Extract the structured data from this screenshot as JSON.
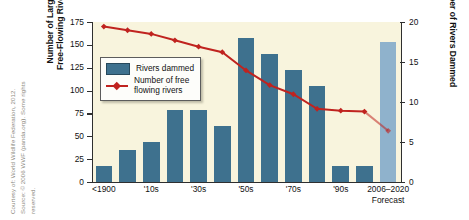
{
  "credit": {
    "lines": [
      "Courtesy of: World Wildlife Federation, 2012.",
      "Source: © 2006 WWF (panda.org). Some rights",
      "reserved."
    ]
  },
  "legend": {
    "items": [
      {
        "label": "Rivers dammed",
        "marker": "bar-swatch",
        "color": "#3e718e"
      },
      {
        "label_line1": "Number of free",
        "label_line2": "flowing rivers",
        "marker": "line-diamond",
        "color": "#c0231f"
      }
    ]
  },
  "axes": {
    "left": {
      "title_line1": "Number of Large",
      "title_line2": "Free-Flowing Rivers",
      "ticks": [
        "0",
        "25",
        "50",
        "75",
        "100",
        "125",
        "150",
        "175"
      ],
      "min": 0,
      "max": 175
    },
    "right": {
      "title": "Number of Rivers Dammed",
      "ticks": [
        "0",
        "5",
        "10",
        "15",
        "20"
      ],
      "min": 0,
      "max": 20
    },
    "x": {
      "tick_labels": [
        {
          "label": "<1900",
          "sub": ""
        },
        {
          "label": "'10s",
          "sub": ""
        },
        {
          "label": "'30s",
          "sub": ""
        },
        {
          "label": "'50s",
          "sub": ""
        },
        {
          "label": "'70s",
          "sub": ""
        },
        {
          "label": "'90s",
          "sub": ""
        },
        {
          "label": "2006–2020",
          "sub": "Forecast"
        }
      ]
    }
  },
  "chart_data": {
    "type": "bar",
    "title": "",
    "xlabel": "",
    "ylabel": "Number of Large Free-Flowing Rivers",
    "y2label": "Number of Rivers Dammed",
    "ylim": [
      0,
      175
    ],
    "y2lim": [
      0,
      20
    ],
    "grid": false,
    "legend_position": "upper-left-inside",
    "categories": [
      "<1900",
      "'00s",
      "'10s",
      "'20s",
      "'30s",
      "'40s",
      "'50s",
      "'60s",
      "'70s",
      "'80s",
      "'90s",
      "2000s",
      "2006–2020 Forecast"
    ],
    "series": [
      {
        "name": "Rivers dammed",
        "axis": "right",
        "type": "bar",
        "color": "#3e718e",
        "unit": "rivers dammed",
        "values": [
          2,
          4,
          5,
          9,
          9,
          7,
          18,
          16,
          14,
          12,
          2,
          2,
          17.5
        ],
        "forecast_index": 12,
        "forecast_color": "#8fb2cc"
      },
      {
        "name": "Number of free flowing rivers",
        "axis": "left",
        "type": "line",
        "color": "#c0231f",
        "marker": "diamond",
        "unit": "free-flowing rivers",
        "values": [
          170,
          166,
          162,
          155,
          148,
          142,
          122,
          106,
          96,
          80,
          78,
          77,
          56
        ],
        "forecast_segment_from_index": 11
      }
    ]
  }
}
